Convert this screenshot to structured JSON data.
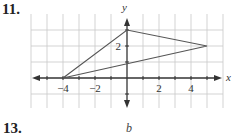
{
  "problems": [
    {
      "number": "11."
    },
    {
      "number": "13.",
      "label": "b"
    }
  ],
  "chart_data": {
    "type": "scatter",
    "title": "",
    "xlabel": "x",
    "ylabel": "y",
    "xlim": [
      -6,
      6
    ],
    "ylim": [
      -1.5,
      4
    ],
    "grid": true,
    "x_tick_labels": [
      "-4",
      "-2",
      "2",
      "4"
    ],
    "y_tick_labels": [
      "2"
    ],
    "polygon": {
      "name": "triangle",
      "vertices": [
        [
          -4,
          0
        ],
        [
          0,
          3
        ],
        [
          5,
          2
        ]
      ]
    },
    "colors": {
      "grid": "#c8c8c8",
      "axis": "#333333",
      "triangle": "#555555"
    }
  }
}
